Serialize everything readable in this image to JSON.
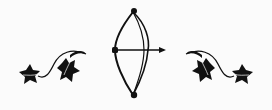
{
  "ornament": {
    "description": "Decorative divider: bow and arrow flanked by ivy vines",
    "colors": {
      "background": "#fbfbfb",
      "ink": "#111111"
    },
    "elements": [
      {
        "name": "bow-and-arrow",
        "icon": "bow-arrow-icon"
      },
      {
        "name": "left-ivy-vine",
        "icon": "ivy-vine-icon"
      },
      {
        "name": "right-ivy-vine",
        "icon": "ivy-vine-icon"
      }
    ]
  }
}
